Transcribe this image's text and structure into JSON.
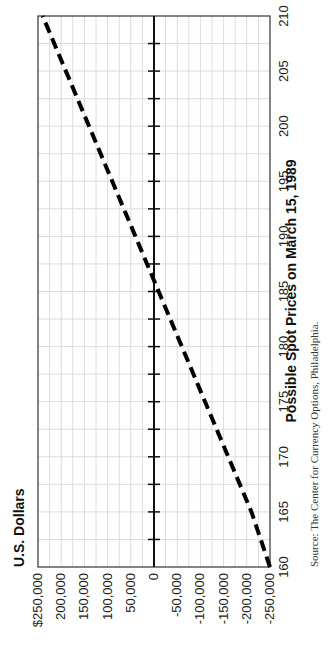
{
  "chart_data": {
    "type": "line",
    "title": "",
    "ylabel": "U.S. Dollars",
    "xlabel": "Possible Spot Prices on March 15, 1989",
    "x": [
      160,
      165,
      170,
      175,
      180,
      185,
      190,
      195,
      200,
      205,
      210
    ],
    "series": [
      {
        "name": "Profit/Loss",
        "style": "dashed",
        "color": "#000000",
        "values": [
          -250000,
          -210000,
          -160000,
          -110000,
          -60000,
          -10000,
          40000,
          90000,
          140000,
          190000,
          240000
        ]
      }
    ],
    "breakeven_spot": 186,
    "xlim": [
      160,
      210
    ],
    "ylim": [
      -250000,
      250000
    ],
    "x_ticks": [
      "160",
      "165",
      "170",
      "175",
      "180",
      "185",
      "190",
      "195",
      "200",
      "205",
      "210"
    ],
    "y_ticks": [
      "$250,000",
      "200,000",
      "150,000",
      "100,000",
      "50,000",
      "0",
      "-50,000",
      "-100,000",
      "-150,000",
      "-200,000",
      "-250,000"
    ],
    "grid": true,
    "orientation": "rotated 90 degrees counterclockwise"
  },
  "labels": {
    "y_title": "U.S. Dollars",
    "x_title": "Possible Spot Prices on March 15, 1989",
    "source": "Source: The Center for Currency Options, Philadelphia."
  }
}
